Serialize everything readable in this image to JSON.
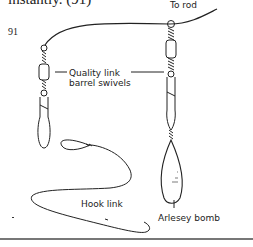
{
  "page": {
    "top_text": "instantly. (91)",
    "figure_number": "91"
  },
  "figure": {
    "labels": {
      "to_rod": "To rod",
      "quality_line1": "Quality link",
      "quality_line2": "barrel swivels",
      "hook_link": "Hook link",
      "arlesey_bomb": "Arlesey bomb"
    }
  }
}
